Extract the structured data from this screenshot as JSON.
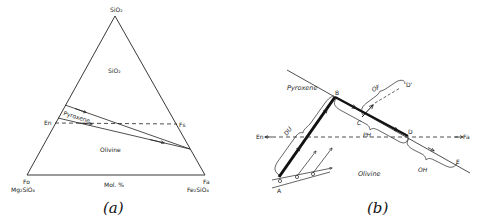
{
  "figure": {
    "panel_a": {
      "caption": "(a)",
      "apex_top": "SiO₂",
      "region_sio2": "SiO₂",
      "region_pyroxene": "Pyroxene",
      "region_olivine": "Olivine",
      "en_label": "En",
      "fs_label": "Fs",
      "bottom_left_top": "Fo",
      "bottom_left_formula": "Mg₂SiO₄",
      "bottom_right_top": "Fa",
      "bottom_right_formula": "Fe₂SiO₄",
      "axis_label": "Mol. %"
    },
    "panel_b": {
      "caption": "(b)",
      "region_pyroxene": "Pyroxene",
      "region_olivine": "Olivine",
      "en_label": "En",
      "fa_label": "Fa",
      "point_a": "A",
      "point_b": "B",
      "point_c": "C",
      "point_d": "D",
      "point_d_prime": "D'",
      "point_e": "E",
      "brace_du": "DU",
      "brace_ph": "PH",
      "brace_of": "OF",
      "brace_oh": "OH"
    },
    "colors": {
      "line": "#222222",
      "background": "#ffffff"
    }
  }
}
